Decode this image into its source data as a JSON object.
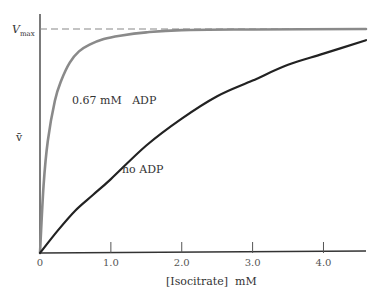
{
  "chart_data": {
    "type": "line",
    "title": "",
    "xlabel": "[Isocitrate]  mM",
    "ylabel": "v̄",
    "xlim": [
      0,
      4.6
    ],
    "ylim": [
      0,
      1.0
    ],
    "x_ticks": [
      0,
      1.0,
      2.0,
      3.0,
      4.0
    ],
    "x_tick_labels": [
      "0",
      "1.0",
      "2.0",
      "3.0",
      "4.0"
    ],
    "y_axis_marker": {
      "label": "V",
      "subscript": "max",
      "value": 1.0,
      "style": "dashed"
    },
    "grid": false,
    "series": [
      {
        "name": "0.67 mM ADP",
        "color": "#8a8a8a",
        "x": [
          0,
          0.05,
          0.11,
          0.21,
          0.3,
          0.42,
          0.55,
          0.7,
          0.9,
          1.13,
          1.5,
          2.0,
          3.0,
          4.6
        ],
        "y": [
          0,
          0.3,
          0.5,
          0.68,
          0.77,
          0.85,
          0.9,
          0.93,
          0.955,
          0.97,
          0.985,
          0.995,
          0.998,
          1.0
        ]
      },
      {
        "name": "no ADP",
        "color": "#222222",
        "x": [
          0,
          0.25,
          0.5,
          0.75,
          1.0,
          1.5,
          2.0,
          2.5,
          3.0,
          3.5,
          4.0,
          4.6
        ],
        "y": [
          0,
          0.1,
          0.19,
          0.26,
          0.33,
          0.48,
          0.6,
          0.7,
          0.77,
          0.84,
          0.89,
          0.95
        ]
      }
    ],
    "annotations": [
      {
        "text": "0.67 mM   ADP",
        "series": "0.67 mM ADP"
      },
      {
        "text": "no ADP",
        "series": "no ADP"
      }
    ]
  }
}
